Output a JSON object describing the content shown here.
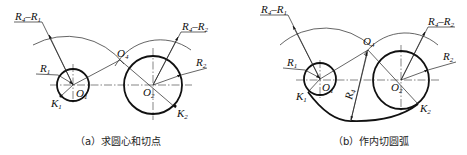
{
  "figure": {
    "panels": [
      {
        "id": "a",
        "caption": "（a）求圆心和切点",
        "labels": {
          "r4_minus_r1": {
            "base": "R",
            "sub1": "4",
            "mid": "–R",
            "sub2": "1"
          },
          "r4_minus_r2": {
            "base": "R",
            "sub1": "4",
            "mid": "–R",
            "sub2": "2"
          },
          "r1": {
            "base": "R",
            "sub": "1"
          },
          "r2": {
            "base": "R",
            "sub": "2"
          },
          "o1": {
            "base": "O",
            "sub": "1"
          },
          "o2": {
            "base": "O",
            "sub": "2"
          },
          "o4": {
            "base": "O",
            "sub": "4"
          },
          "k1": {
            "base": "K",
            "sub": "1"
          },
          "k2": {
            "base": "K",
            "sub": "2"
          }
        }
      },
      {
        "id": "b",
        "caption": "（b）作内切圆弧",
        "labels": {
          "r4_minus_r1": {
            "base": "R",
            "sub1": "4",
            "mid": "–R",
            "sub2": "1"
          },
          "r4_minus_r2": {
            "base": "R",
            "sub1": "4",
            "mid": "–R",
            "sub2": "2"
          },
          "r1": {
            "base": "R",
            "sub": "1"
          },
          "r2": {
            "base": "R",
            "sub": "2"
          },
          "r4": {
            "base": "R",
            "sub": "4"
          },
          "o1": {
            "base": "O",
            "sub": "1"
          },
          "o2": {
            "base": "O",
            "sub": "2"
          },
          "o4": {
            "base": "O",
            "sub": "4"
          },
          "k1": {
            "base": "K",
            "sub": "1"
          },
          "k2": {
            "base": "K",
            "sub": "2"
          }
        }
      }
    ]
  }
}
